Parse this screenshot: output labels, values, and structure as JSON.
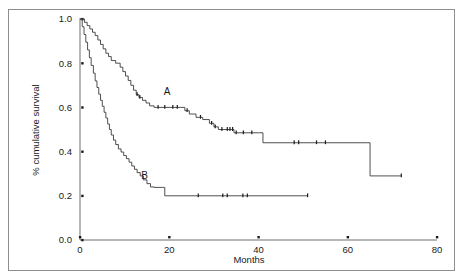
{
  "chart_data": {
    "type": "line",
    "title": "",
    "subtitle": "",
    "xlabel": "Months",
    "ylabel": "% cumulative survival",
    "xlim": [
      0,
      80
    ],
    "ylim": [
      0.0,
      1.0
    ],
    "xticks": [
      0,
      20,
      40,
      60,
      80
    ],
    "xtick_labels": [
      "0",
      "20",
      "40",
      "60",
      "80"
    ],
    "yticks": [
      0.0,
      0.2,
      0.4,
      0.6,
      0.8,
      1.0
    ],
    "ytick_labels": [
      "0.0",
      "0.2",
      "0.4",
      "0.6",
      "0.8",
      "1.0"
    ],
    "grid": false,
    "legend_position": "inline-annotation",
    "annotations": [
      {
        "text": "A",
        "x": 19.5,
        "y": 0.655
      },
      {
        "text": "B",
        "x": 14.5,
        "y": 0.275
      }
    ],
    "series": [
      {
        "name": "A",
        "label": "A",
        "style": "step-post",
        "color": "#3c3c3c",
        "points": [
          [
            0.0,
            1.0
          ],
          [
            1.0,
            0.985
          ],
          [
            1.6,
            0.97
          ],
          [
            2.2,
            0.955
          ],
          [
            2.8,
            0.94
          ],
          [
            3.4,
            0.925
          ],
          [
            4.0,
            0.905
          ],
          [
            4.6,
            0.885
          ],
          [
            5.2,
            0.865
          ],
          [
            5.8,
            0.845
          ],
          [
            6.4,
            0.83
          ],
          [
            7.0,
            0.812
          ],
          [
            8.0,
            0.8
          ],
          [
            9.0,
            0.782
          ],
          [
            9.6,
            0.762
          ],
          [
            10.2,
            0.742
          ],
          [
            10.8,
            0.722
          ],
          [
            11.4,
            0.7
          ],
          [
            12.0,
            0.678
          ],
          [
            12.6,
            0.658
          ],
          [
            13.2,
            0.645
          ],
          [
            14.0,
            0.632
          ],
          [
            14.8,
            0.62
          ],
          [
            15.6,
            0.607
          ],
          [
            16.6,
            0.6
          ],
          [
            22.5,
            0.6
          ],
          [
            23.5,
            0.585
          ],
          [
            24.5,
            0.57
          ],
          [
            26.0,
            0.555
          ],
          [
            27.5,
            0.545
          ],
          [
            29.0,
            0.528
          ],
          [
            30.0,
            0.512
          ],
          [
            31.0,
            0.5
          ],
          [
            33.5,
            0.5
          ],
          [
            34.5,
            0.485
          ],
          [
            40.0,
            0.485
          ],
          [
            41.0,
            0.44
          ],
          [
            64.5,
            0.44
          ],
          [
            65.0,
            0.29
          ],
          [
            72.0,
            0.29
          ]
        ],
        "censor_times": [
          12.8,
          13.4,
          17.5,
          19.0,
          20.8,
          21.8,
          24.0,
          27.0,
          29.5,
          30.3,
          31.8,
          33.0,
          33.6,
          34.2,
          35.0,
          36.6,
          38.5,
          48.0,
          49.0,
          53.0,
          55.0,
          72.0
        ]
      },
      {
        "name": "B",
        "label": "B",
        "style": "step-post",
        "color": "#3c3c3c",
        "points": [
          [
            0.0,
            1.0
          ],
          [
            0.5,
            0.965
          ],
          [
            0.9,
            0.93
          ],
          [
            1.3,
            0.895
          ],
          [
            1.7,
            0.86
          ],
          [
            2.1,
            0.825
          ],
          [
            2.5,
            0.79
          ],
          [
            3.0,
            0.755
          ],
          [
            3.4,
            0.72
          ],
          [
            3.8,
            0.69
          ],
          [
            4.2,
            0.66
          ],
          [
            4.6,
            0.632
          ],
          [
            5.0,
            0.605
          ],
          [
            5.4,
            0.578
          ],
          [
            5.8,
            0.552
          ],
          [
            6.2,
            0.525
          ],
          [
            6.6,
            0.5
          ],
          [
            7.0,
            0.475
          ],
          [
            7.5,
            0.452
          ],
          [
            8.0,
            0.432
          ],
          [
            8.6,
            0.412
          ],
          [
            9.2,
            0.398
          ],
          [
            9.8,
            0.382
          ],
          [
            10.4,
            0.368
          ],
          [
            11.0,
            0.352
          ],
          [
            11.6,
            0.335
          ],
          [
            12.2,
            0.32
          ],
          [
            12.8,
            0.305
          ],
          [
            13.5,
            0.29
          ],
          [
            14.2,
            0.272
          ],
          [
            15.0,
            0.255
          ],
          [
            15.8,
            0.24
          ],
          [
            16.6,
            0.238
          ],
          [
            18.5,
            0.238
          ],
          [
            19.0,
            0.2
          ],
          [
            51.0,
            0.2
          ]
        ],
        "censor_times": [
          26.5,
          32.0,
          33.0,
          36.5,
          37.5,
          51.0
        ]
      }
    ]
  }
}
